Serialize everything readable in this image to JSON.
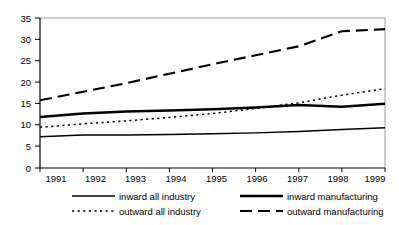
{
  "chart_data": {
    "type": "line",
    "title": "",
    "subtitle": "",
    "xlabel": "",
    "ylabel": "",
    "categories": [
      "1991",
      "1992",
      "1993",
      "1994",
      "1995",
      "1996",
      "1997",
      "1998",
      "1999"
    ],
    "x": [
      1991,
      1992,
      1993,
      1994,
      1995,
      1996,
      1997,
      1998,
      1999
    ],
    "xlim": [
      1991,
      1999
    ],
    "ylim": [
      0,
      35
    ],
    "yticks": [
      "0",
      "5",
      "10",
      "15",
      "20",
      "25",
      "30",
      "35"
    ],
    "ytick_values": [
      0,
      5,
      10,
      15,
      20,
      25,
      30,
      35
    ],
    "grid": false,
    "legend_position": "bottom",
    "series": [
      {
        "name": "inward all industry",
        "style": "solid-thin",
        "color": "#000000",
        "values": [
          7.3,
          7.7,
          7.7,
          7.8,
          8.0,
          8.2,
          8.5,
          9.0,
          9.4
        ]
      },
      {
        "name": "outward all industry",
        "style": "dotted",
        "color": "#000000",
        "values": [
          9.5,
          10.3,
          11.0,
          11.8,
          12.7,
          13.9,
          15.2,
          17.0,
          18.5
        ]
      },
      {
        "name": "inward manufacturing",
        "style": "solid-thick",
        "color": "#000000",
        "values": [
          11.9,
          12.7,
          13.2,
          13.4,
          13.7,
          14.1,
          14.7,
          14.3,
          15.0
        ]
      },
      {
        "name": "outward manufacturing",
        "style": "dashed",
        "color": "#000000",
        "values": [
          15.8,
          17.8,
          19.8,
          22.0,
          24.2,
          26.3,
          28.4,
          31.9,
          32.4
        ]
      }
    ]
  },
  "legend": {
    "items": [
      {
        "label": "inward all industry",
        "style": "solid-thin"
      },
      {
        "label": "outward all industry",
        "style": "dotted"
      },
      {
        "label": "inward manufacturing",
        "style": "solid-thick"
      },
      {
        "label": "outward manufacturing",
        "style": "dashed"
      }
    ]
  },
  "axes": {
    "y_tick_labels": [
      "35",
      "30",
      "25",
      "20",
      "15",
      "10",
      "5",
      "0"
    ],
    "x_tick_labels": [
      "1991",
      "1992",
      "1993",
      "1994",
      "1995",
      "1996",
      "1997",
      "1998",
      "1999"
    ]
  },
  "colors": {
    "line": "#000000",
    "axis": "#000000",
    "frame": "#9a9a9a",
    "background": "#ffffff"
  }
}
